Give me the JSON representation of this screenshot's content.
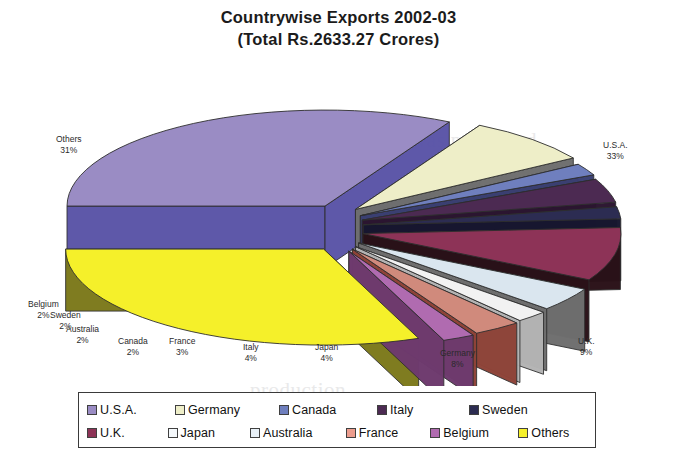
{
  "chart_data": {
    "type": "pie",
    "title": "Countrywise Exports 2002-03",
    "subtitle": "(Total Rs.2633.27 Crores)",
    "total_label": "Total Rs.2633.27 Crores",
    "total_value": 2633.27,
    "units": "Rs. Crores",
    "exploded": true,
    "three_d": true,
    "legend_position": "bottom",
    "grid": false,
    "categories": [
      "U.S.A.",
      "Germany",
      "Canada",
      "Italy",
      "Sweden",
      "U.K.",
      "Japan",
      "Australia",
      "France",
      "Belgium",
      "Others"
    ],
    "values": [
      33,
      8,
      2,
      4,
      2,
      9,
      4,
      2,
      3,
      2,
      31
    ],
    "value_unit": "%",
    "slices": [
      {
        "name": "U.S.A.",
        "percent": 33,
        "label": "U.S.A.",
        "percent_label": "33%",
        "top_color": "#9a8cc4",
        "side_color": "#5b55a8"
      },
      {
        "name": "Germany",
        "percent": 8,
        "label": "Germany",
        "percent_label": "8%",
        "top_color": "#eeeec8",
        "side_color": "#6f6f6f"
      },
      {
        "name": "Canada",
        "percent": 2,
        "label": "Canada",
        "percent_label": "2%",
        "top_color": "#6f7fbe",
        "side_color": "#3a3f72"
      },
      {
        "name": "Italy",
        "percent": 4,
        "label": "Italy",
        "percent_label": "4%",
        "top_color": "#4c2a52",
        "side_color": "#2b1530"
      },
      {
        "name": "Sweden",
        "percent": 2,
        "label": "Sweden",
        "percent_label": "2%",
        "top_color": "#2c2c52",
        "side_color": "#17172f"
      },
      {
        "name": "U.K.",
        "percent": 9,
        "label": "U.K.",
        "percent_label": "9%",
        "top_color": "#8d3357",
        "side_color": "#2a1118"
      },
      {
        "name": "Japan",
        "percent": 4,
        "label": "Japan",
        "percent_label": "4%",
        "top_color": "#dae6ef",
        "side_color": "#6f6f6f"
      },
      {
        "name": "Australia",
        "percent": 2,
        "label": "Australia",
        "percent_label": "2%",
        "top_color": "#f2f2f2",
        "side_color": "#b4b4b4"
      },
      {
        "name": "France",
        "percent": 3,
        "label": "France",
        "percent_label": "3%",
        "top_color": "#d08a7c",
        "side_color": "#8e4338"
      },
      {
        "name": "Belgium",
        "percent": 2,
        "label": "Belgium",
        "percent_label": "2%",
        "top_color": "#b06bb0",
        "side_color": "#6e3a6e"
      },
      {
        "name": "Others",
        "percent": 31,
        "label": "Others",
        "percent_label": "31%",
        "top_color": "#f5f02a",
        "side_color": "#7d7a1c"
      }
    ]
  },
  "legend": {
    "rows": [
      [
        {
          "label": "U.S.A.",
          "color": "#9a8cc4"
        },
        {
          "label": "Germany",
          "color": "#eeeec8"
        },
        {
          "label": "Canada",
          "color": "#6f7fbe"
        },
        {
          "label": "Italy",
          "color": "#4c2a52"
        },
        {
          "label": "Sweden",
          "color": "#2c2c52"
        }
      ],
      [
        {
          "label": "U.K.",
          "color": "#8d3357"
        },
        {
          "label": "Japan",
          "color": "#f4f8fb"
        },
        {
          "label": "Australia",
          "color": "#e8f0f7"
        },
        {
          "label": "France",
          "color": "#ec9d8e"
        },
        {
          "label": "Belgium",
          "color": "#b06bb0"
        },
        {
          "label": "Others",
          "color": "#f5f02a"
        }
      ]
    ]
  },
  "background_text": {
    "line1": "p was ... published ... ",
    "line2": "million it th nec",
    "line3": "separate"
  }
}
